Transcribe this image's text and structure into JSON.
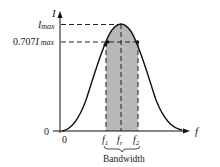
{
  "diagram": {
    "y_axis": {
      "label": "I"
    },
    "x_axis": {
      "label": "f"
    },
    "origin": {
      "x_label": "0",
      "y_label": "0"
    },
    "levels": {
      "imax": {
        "label_main": "I",
        "label_sub": "max"
      },
      "half_power": {
        "label_prefix": "0.707",
        "label_main": "I",
        "label_sub": "max"
      }
    },
    "frequencies": {
      "f1": {
        "main": "f",
        "sub": "1"
      },
      "fr": {
        "main": "f",
        "sub": "r"
      },
      "f2": {
        "main": "f",
        "sub": "2"
      }
    },
    "bandwidth_label": "Bandwidth",
    "colors": {
      "curve": "#111111",
      "shade": "#b8b8b8",
      "dash": "#222222"
    }
  }
}
